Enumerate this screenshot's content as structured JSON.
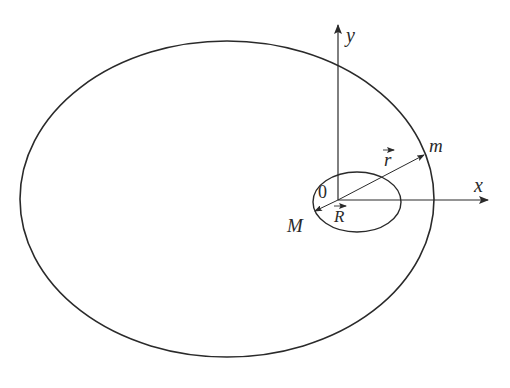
{
  "diagram": {
    "colors": {
      "stroke": "#2a2a2a",
      "background": "#ffffff"
    },
    "labels": {
      "y_axis": "y",
      "x_axis": "x",
      "origin": "0",
      "mass_small": "m",
      "mass_large": "M",
      "vector_r": "r",
      "vector_R": "R"
    },
    "elements": {
      "large_orbit": {
        "cx": 227,
        "cy": 199,
        "rx": 207,
        "ry": 158
      },
      "small_orbit": {
        "cx": 357,
        "cy": 202,
        "rx": 44,
        "ry": 30
      },
      "origin": {
        "x": 338,
        "y": 200
      },
      "m_position": {
        "x": 424,
        "y": 155
      },
      "M_position": {
        "x": 316,
        "y": 211
      }
    }
  }
}
